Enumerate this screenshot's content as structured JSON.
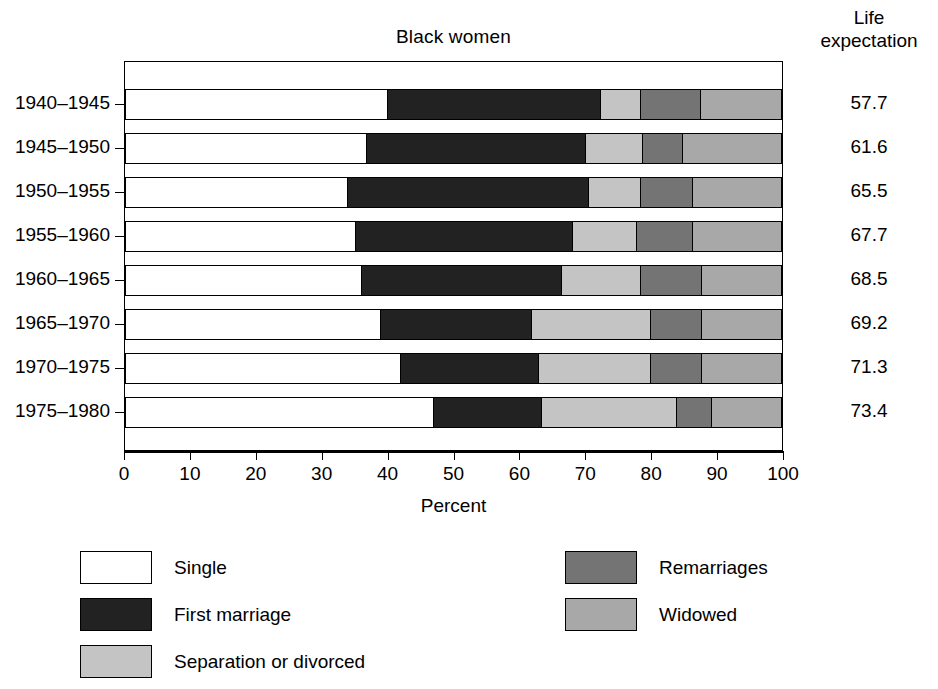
{
  "chart_data": {
    "type": "bar",
    "subtype": "horizontal-stacked-100",
    "title": "Black women",
    "xlabel": "Percent",
    "ylabel": "",
    "xlim": [
      0,
      100
    ],
    "xticks": [
      0,
      10,
      20,
      30,
      40,
      50,
      60,
      70,
      80,
      90,
      100
    ],
    "grid": false,
    "legend_position": "below-plot",
    "categories": [
      "1940–1945",
      "1945–1950",
      "1950–1955",
      "1955–1960",
      "1960–1965",
      "1965–1970",
      "1970–1975",
      "1975–1980"
    ],
    "series": [
      {
        "name": "Single",
        "color": "#ffffff",
        "values": [
          40.0,
          36.8,
          34.0,
          35.2,
          36.0,
          39.0,
          42.0,
          47.0
        ]
      },
      {
        "name": "First marriage",
        "color": "#222222",
        "values": [
          32.5,
          33.3,
          36.6,
          33.0,
          30.5,
          23.0,
          21.0,
          16.5
        ]
      },
      {
        "name": "Separation or divorced",
        "color": "#c4c4c4",
        "values": [
          6.1,
          8.8,
          8.0,
          9.8,
          12.1,
          18.0,
          17.0,
          20.5
        ]
      },
      {
        "name": "Remarriages",
        "color": "#747474",
        "values": [
          9.1,
          6.0,
          7.9,
          8.5,
          9.2,
          7.8,
          7.8,
          5.4
        ]
      },
      {
        "name": "Widowed",
        "color": "#a8a8a8",
        "values": [
          12.3,
          15.1,
          13.5,
          13.5,
          12.2,
          12.2,
          12.2,
          10.6
        ]
      }
    ],
    "annotations": {
      "right_column_header": "Life expectation",
      "right_column_values": [
        57.7,
        61.6,
        65.5,
        67.7,
        68.5,
        69.2,
        71.3,
        73.4
      ]
    }
  },
  "title": "Black women",
  "life_expectation": {
    "header_line1": "Life",
    "header_line2": "expectation",
    "values": [
      "57.7",
      "61.6",
      "65.5",
      "67.7",
      "68.5",
      "69.2",
      "71.3",
      "73.4"
    ]
  },
  "y_axis": {
    "labels": [
      "1940–1945",
      "1945–1950",
      "1950–1955",
      "1955–1960",
      "1960–1965",
      "1965–1970",
      "1970–1975",
      "1975–1980"
    ]
  },
  "x_axis": {
    "title": "Percent",
    "ticks": [
      "0",
      "10",
      "20",
      "30",
      "40",
      "50",
      "60",
      "70",
      "80",
      "90",
      "100"
    ]
  },
  "legend": {
    "items": [
      {
        "label": "Single",
        "color": "#ffffff"
      },
      {
        "label": "First marriage",
        "color": "#222222"
      },
      {
        "label": "Separation or divorced",
        "color": "#c4c4c4"
      },
      {
        "label": "Remarriages",
        "color": "#747474"
      },
      {
        "label": "Widowed",
        "color": "#a8a8a8"
      }
    ]
  }
}
